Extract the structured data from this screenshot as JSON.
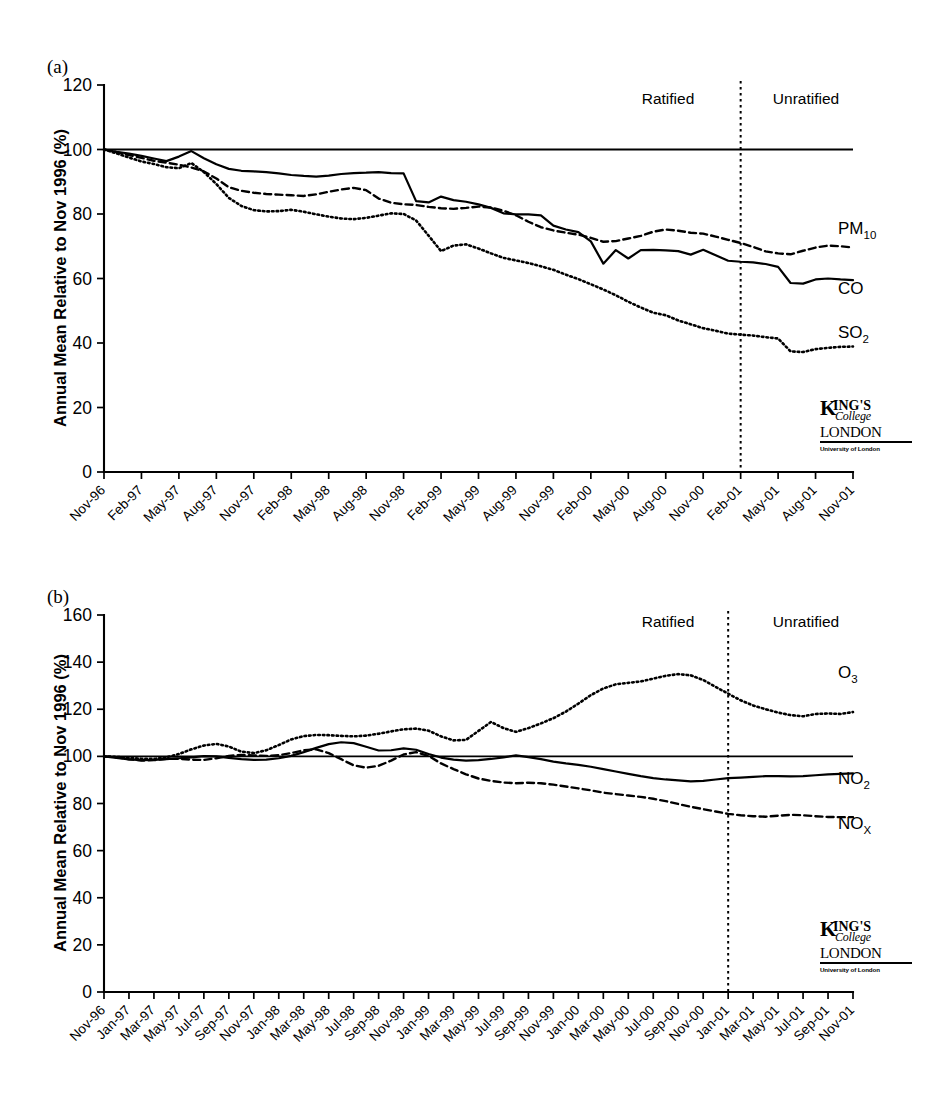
{
  "figure": {
    "panels": [
      {
        "id": "a",
        "letter": "(a)",
        "ylabel": "Annual Mean Relative to Nov 1996 (%)",
        "region_left": "Ratified",
        "region_right": "Unratified"
      },
      {
        "id": "b",
        "letter": "(b)",
        "ylabel": "Annual Mean Relative to Nov 1996 (%)",
        "region_left": "Ratified",
        "region_right": "Unratified"
      }
    ],
    "logo": {
      "k": "K",
      "ings": "ING'S",
      "college": "College",
      "london": "LONDON",
      "university": "University of London"
    }
  },
  "chart_data": [
    {
      "type": "line",
      "panel": "a",
      "title": "(a)",
      "xlabel": "",
      "ylabel": "Annual Mean Relative to Nov 1996 (%)",
      "ylim": [
        0,
        120
      ],
      "yticks": [
        0,
        20,
        40,
        60,
        80,
        100,
        120
      ],
      "grid": false,
      "legend_position": "right-inline",
      "baseline_value": 100,
      "divider_label_left": "Ratified",
      "divider_label_right": "Unratified",
      "divider_x_index": 51,
      "n_points": 61,
      "tick_labels": [
        "Nov-96",
        "Feb-97",
        "May-97",
        "Aug-97",
        "Nov-97",
        "Feb-98",
        "May-98",
        "Aug-98",
        "Nov-98",
        "Feb-99",
        "May-99",
        "Aug-99",
        "Nov-99",
        "Feb-00",
        "May-00",
        "Aug-00",
        "Nov-00",
        "Feb-01",
        "May-01",
        "Aug-01",
        "Nov-01"
      ],
      "tick_label_interval": 3,
      "series": [
        {
          "name": "PM10",
          "label": "PM",
          "label_sub": "10",
          "style": "dashed",
          "values": [
            100,
            99.2,
            98.3,
            97.4,
            96.5,
            95.9,
            95.3,
            94.4,
            93.2,
            91.0,
            88.3,
            87.2,
            86.6,
            86.2,
            86.0,
            85.8,
            85.6,
            86.1,
            86.9,
            87.6,
            88.1,
            87.4,
            84.8,
            83.5,
            83.0,
            82.8,
            82.2,
            81.8,
            81.6,
            81.9,
            82.3,
            82.0,
            81.0,
            79.6,
            77.6,
            75.9,
            74.9,
            74.2,
            73.6,
            72.6,
            71.4,
            71.6,
            72.4,
            73.2,
            74.5,
            75.2,
            74.8,
            74.2,
            73.9,
            73.0,
            72.0,
            71.0,
            69.8,
            68.4,
            67.8,
            67.5,
            68.6,
            69.6,
            70.2,
            70.0,
            69.6
          ]
        },
        {
          "name": "CO",
          "label": "CO",
          "label_sub": "",
          "style": "solid",
          "values": [
            100,
            99.3,
            98.7,
            98.0,
            97.2,
            96.4,
            97.8,
            99.5,
            97.3,
            95.4,
            94.0,
            93.4,
            93.2,
            93.0,
            92.6,
            92.1,
            91.8,
            91.6,
            91.9,
            92.4,
            92.7,
            92.8,
            93.0,
            92.7,
            92.6,
            84.0,
            83.6,
            85.4,
            84.3,
            83.8,
            83.0,
            81.9,
            80.2,
            79.9,
            79.9,
            79.6,
            76.4,
            75.2,
            74.4,
            71.5,
            64.6,
            68.8,
            66.2,
            68.8,
            68.9,
            68.7,
            68.5,
            67.4,
            68.9,
            67.2,
            65.5,
            65.2,
            65.0,
            64.5,
            63.6,
            58.6,
            58.4,
            59.7,
            60.0,
            59.7,
            59.5
          ]
        },
        {
          "name": "SO2",
          "label": "SO",
          "label_sub": "2",
          "style": "dotted",
          "values": [
            100,
            98.8,
            97.5,
            96.3,
            95.5,
            94.5,
            94.2,
            95.8,
            93.0,
            89.3,
            85.0,
            82.5,
            81.2,
            80.8,
            80.9,
            81.3,
            80.7,
            79.9,
            79.2,
            78.6,
            78.4,
            78.8,
            79.5,
            80.2,
            80.0,
            78.0,
            73.3,
            68.5,
            70.2,
            70.6,
            69.3,
            67.8,
            66.4,
            65.6,
            64.8,
            63.8,
            62.7,
            61.2,
            59.8,
            58.2,
            56.6,
            54.8,
            52.8,
            51.0,
            49.4,
            48.6,
            47.0,
            45.8,
            44.6,
            43.8,
            42.9,
            42.6,
            42.3,
            41.8,
            41.4,
            37.4,
            37.2,
            38.1,
            38.5,
            38.8,
            38.9
          ]
        }
      ]
    },
    {
      "type": "line",
      "panel": "b",
      "title": "(b)",
      "xlabel": "",
      "ylabel": "Annual Mean Relative to Nov 1996 (%)",
      "ylim": [
        0,
        160
      ],
      "yticks": [
        0,
        20,
        40,
        60,
        80,
        100,
        120,
        140,
        160
      ],
      "grid": false,
      "legend_position": "right-inline",
      "baseline_value": 100,
      "divider_label_left": "Ratified",
      "divider_label_right": "Unratified",
      "divider_x_index": 50,
      "n_points": 61,
      "tick_labels": [
        "Nov-96",
        "Jan-97",
        "Mar-97",
        "May-97",
        "Jul-97",
        "Sep-97",
        "Nov-97",
        "Jan-98",
        "Mar-98",
        "May-98",
        "Jul-98",
        "Sep-98",
        "Nov-98",
        "Jan-99",
        "Mar-99",
        "May-99",
        "Jul-99",
        "Sep-99",
        "Nov-99",
        "Jan-00",
        "Mar-00",
        "May-00",
        "Jul-00",
        "Sep-00",
        "Nov-00",
        "Jan-01",
        "Mar-01",
        "May-01",
        "Jul-01",
        "Sep-01",
        "Nov-01"
      ],
      "tick_label_interval": 2,
      "series": [
        {
          "name": "O3",
          "label": "O",
          "label_sub": "3",
          "style": "dotted",
          "values": [
            100,
            99.8,
            99.4,
            99.0,
            98.9,
            99.6,
            101.0,
            103.0,
            104.6,
            105.3,
            104.2,
            102.0,
            101.4,
            102.6,
            104.8,
            107.2,
            108.6,
            109.1,
            109.0,
            108.7,
            108.5,
            108.8,
            109.6,
            110.6,
            111.5,
            111.8,
            110.9,
            108.5,
            106.8,
            107.0,
            110.8,
            114.6,
            112.0,
            110.4,
            112.0,
            114.0,
            116.2,
            119.0,
            122.4,
            126.0,
            128.8,
            130.6,
            131.2,
            131.8,
            133.0,
            134.2,
            134.9,
            134.4,
            132.4,
            129.5,
            126.6,
            123.8,
            121.6,
            120.0,
            118.6,
            117.5,
            117.0,
            118.0,
            118.2,
            118.0,
            118.8
          ]
        },
        {
          "name": "NO2",
          "label": "NO",
          "label_sub": "2",
          "style": "solid",
          "values": [
            100,
            99.4,
            98.7,
            98.4,
            98.5,
            98.8,
            99.2,
            99.6,
            100.1,
            100.0,
            99.4,
            98.8,
            98.5,
            98.6,
            99.2,
            100.2,
            101.8,
            103.6,
            105.2,
            106.0,
            105.6,
            104.1,
            102.5,
            102.6,
            103.4,
            102.8,
            101.0,
            99.5,
            98.6,
            98.2,
            98.4,
            98.9,
            99.6,
            100.4,
            99.7,
            98.8,
            97.8,
            97.0,
            96.4,
            95.6,
            94.6,
            93.6,
            92.6,
            91.6,
            90.8,
            90.2,
            89.8,
            89.4,
            89.6,
            90.2,
            90.8,
            91.0,
            91.3,
            91.6,
            91.6,
            91.5,
            91.6,
            92.0,
            92.4,
            92.6,
            92.8
          ]
        },
        {
          "name": "NOx",
          "label": "NO",
          "label_sub": "X",
          "style": "dashed",
          "values": [
            100,
            99.6,
            98.8,
            98.2,
            98.4,
            99.0,
            99.0,
            98.6,
            98.5,
            99.2,
            100.2,
            100.6,
            100.4,
            100.2,
            100.5,
            101.4,
            102.6,
            103.0,
            101.4,
            98.8,
            96.2,
            95.2,
            96.0,
            98.2,
            100.8,
            101.8,
            100.2,
            97.0,
            94.6,
            92.4,
            90.6,
            89.6,
            88.9,
            88.6,
            88.8,
            88.6,
            88.0,
            87.2,
            86.4,
            85.6,
            84.6,
            84.0,
            83.4,
            82.8,
            82.0,
            81.0,
            79.8,
            78.6,
            77.6,
            76.6,
            75.6,
            75.0,
            74.6,
            74.4,
            74.8,
            75.2,
            75.0,
            74.6,
            74.3,
            74.2,
            74.2
          ]
        }
      ]
    }
  ]
}
